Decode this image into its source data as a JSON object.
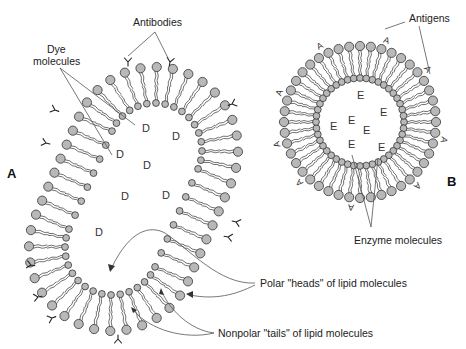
{
  "figure": {
    "panel_labels": [
      {
        "id": "A",
        "text": "A",
        "x": 7,
        "y": 178
      },
      {
        "id": "B",
        "text": "B",
        "x": 447,
        "y": 186
      }
    ],
    "callouts": {
      "antibodies": {
        "text": "Antibodies",
        "x": 140,
        "y": 26
      },
      "dye_molecules": {
        "line1": "Dye",
        "line2": "molecules",
        "x": 54,
        "y": 52
      },
      "antigens": {
        "text": "Antigens",
        "x": 410,
        "y": 20
      },
      "enzyme_molecules": {
        "text": "Enzyme molecules",
        "x": 354,
        "y": 244
      },
      "polar_heads": {
        "text": "Polar \"heads\" of lipid molecules",
        "x": 260,
        "y": 287
      },
      "nonpolar_tails": {
        "text": "Nonpolar \"tails\" of lipid molecules",
        "x": 218,
        "y": 337
      }
    },
    "liposome_A": {
      "description": "Elongated liposome with antibodies on surface, dye molecules inside",
      "cap1_center": [
        155,
        150
      ],
      "cap2_center": [
        112,
        248
      ],
      "outer_radius": 83,
      "inner_radius": 47,
      "interior_symbol": "D",
      "interior_positions": [
        [
          142,
          132
        ],
        [
          172,
          140
        ],
        [
          116,
          158
        ],
        [
          143,
          169
        ],
        [
          121,
          200
        ],
        [
          162,
          199
        ],
        [
          95,
          236
        ]
      ],
      "surface_marker": "Y",
      "surface_marker_name": "antibody"
    },
    "liposome_B": {
      "description": "Spherical liposome with antigens on surface, enzyme molecules inside",
      "center": [
        360,
        122
      ],
      "outer_radius": 76,
      "inner_radius": 44,
      "interior_symbol": "E",
      "interior_positions": [
        [
          357,
          99
        ],
        [
          348,
          124
        ],
        [
          380,
          116
        ],
        [
          330,
          130
        ],
        [
          363,
          134
        ],
        [
          348,
          148
        ],
        [
          378,
          151
        ]
      ],
      "surface_marker": "A",
      "surface_marker_name": "antigen"
    }
  }
}
